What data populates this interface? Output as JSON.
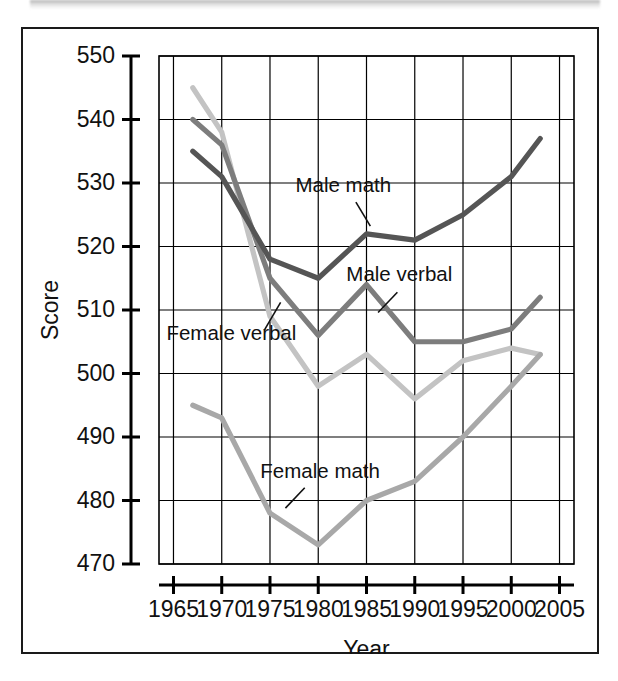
{
  "figure": {
    "frame_border_color": "#1a1a1a",
    "background": "#ffffff"
  },
  "chart_data": {
    "type": "line",
    "title": "",
    "xlabel": "Year",
    "ylabel": "Score",
    "xlim": [
      1963.5,
      2006.5
    ],
    "ylim": [
      470,
      550
    ],
    "xticks": [
      1965,
      1970,
      1975,
      1980,
      1985,
      1990,
      1995,
      2000,
      2005
    ],
    "yticks": [
      470,
      480,
      490,
      500,
      510,
      520,
      530,
      540,
      550
    ],
    "xtick_labels": [
      "1965",
      "1970",
      "1975",
      "1980",
      "1985",
      "1990",
      "1995",
      "2000",
      "2005"
    ],
    "ytick_labels": [
      "470",
      "480",
      "490",
      "500",
      "510",
      "520",
      "530",
      "540",
      "550"
    ],
    "grid": true,
    "legend": "annotations-inline",
    "x": [
      1967,
      1970,
      1975,
      1980,
      1985,
      1990,
      1995,
      2000,
      2003
    ],
    "series": [
      {
        "name": "Male math",
        "color": "#555555",
        "values": [
          535,
          531,
          518,
          515,
          522,
          521,
          525,
          531,
          537
        ]
      },
      {
        "name": "Male verbal",
        "color": "#7d7d7d",
        "values": [
          540,
          536,
          515,
          506,
          514,
          505,
          505,
          507,
          512
        ]
      },
      {
        "name": "Female verbal",
        "color": "#c3c3c3",
        "values": [
          545,
          538,
          509,
          498,
          503,
          496,
          502,
          504,
          503
        ]
      },
      {
        "name": "Female math",
        "color": "#a8a8a8",
        "values": [
          495,
          493,
          478,
          473,
          480,
          483,
          490,
          498,
          503
        ]
      }
    ],
    "annotations": [
      {
        "label": "Male math",
        "x": 1982.6,
        "y": 528.6
      },
      {
        "label": "Male verbal",
        "x": 1988.4,
        "y": 514.6
      },
      {
        "label": "Female verbal",
        "x": 1971.0,
        "y": 505.3
      },
      {
        "label": "Female math",
        "x": 1980.2,
        "y": 483.6
      }
    ]
  }
}
